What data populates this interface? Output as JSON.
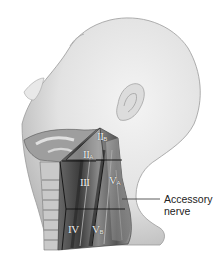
{
  "figure": {
    "levels": [
      {
        "id": "IIB",
        "roman": "II",
        "sub": "B"
      },
      {
        "id": "IIA",
        "roman": "II",
        "sub": "A"
      },
      {
        "id": "III",
        "roman": "III",
        "sub": ""
      },
      {
        "id": "VA",
        "roman": "V",
        "sub": "A"
      },
      {
        "id": "IV",
        "roman": "IV",
        "sub": ""
      },
      {
        "id": "VB",
        "roman": "V",
        "sub": "B"
      }
    ],
    "callout": {
      "line1": "Accessory",
      "line2": "nerve"
    },
    "colors": {
      "skin": "#e6e6e6",
      "skin_shadow": "#bdbdbd",
      "muscle_dark": "#3a3a3a",
      "muscle_mid": "#7a7a7a",
      "boundary_line": "#111111",
      "background": "#ffffff"
    }
  }
}
